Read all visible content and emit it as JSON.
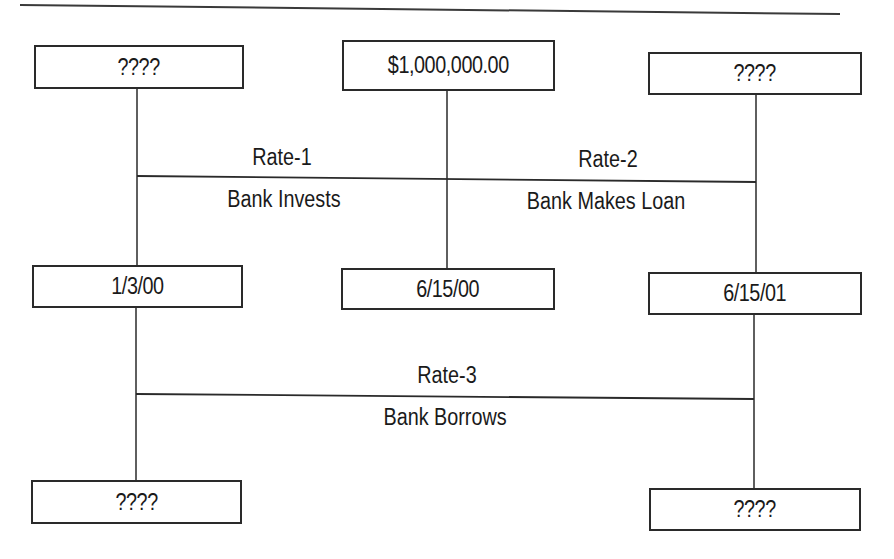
{
  "diagram": {
    "type": "interest-rate-timeline",
    "top_row": {
      "left": {
        "text": "????"
      },
      "center": {
        "text": "$1,000,000.00"
      },
      "right": {
        "text": "????"
      }
    },
    "date_row": {
      "left": {
        "text": "1/3/00"
      },
      "center": {
        "text": "6/15/00"
      },
      "right": {
        "text": "6/15/01"
      }
    },
    "bottom_row": {
      "left": {
        "text": "????"
      },
      "right": {
        "text": "????"
      }
    },
    "upper_link": {
      "left_rate": "Rate-1",
      "left_desc": "Bank Invests",
      "right_rate": "Rate-2",
      "right_desc": "Bank Makes Loan"
    },
    "lower_link": {
      "rate": "Rate-3",
      "desc": "Bank Borrows"
    },
    "colors": {
      "line": "#2a2a2a",
      "background": "#ffffff"
    }
  }
}
